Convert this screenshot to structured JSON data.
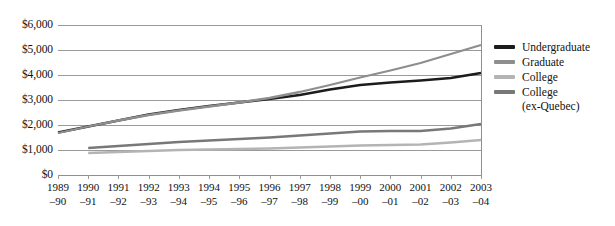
{
  "chart_data": {
    "type": "line",
    "title": "",
    "subtitle": "",
    "xlabel": "",
    "ylabel": "",
    "ylim": [
      0,
      6000
    ],
    "ytick_values": [
      0,
      1000,
      2000,
      3000,
      4000,
      5000,
      6000
    ],
    "ytick_labels": [
      "$0",
      "$1,000",
      "$2,000",
      "$3,000",
      "$4,000",
      "$5,000",
      "$6,000"
    ],
    "grid": true,
    "grid_axis": "y",
    "legend_position": "right",
    "categories": [
      "1989–90",
      "1990–91",
      "1991–92",
      "1992–93",
      "1993–94",
      "1994–95",
      "1995–96",
      "1996–97",
      "1997–98",
      "1998–99",
      "1999–00",
      "2000–01",
      "2001–02",
      "2002–03",
      "2003–04"
    ],
    "xtick_labels": [
      {
        "line1": "1989",
        "line2": "–90"
      },
      {
        "line1": "1990",
        "line2": "–91"
      },
      {
        "line1": "1991",
        "line2": "–92"
      },
      {
        "line1": "1992",
        "line2": "–93"
      },
      {
        "line1": "1993",
        "line2": "–94"
      },
      {
        "line1": "1994",
        "line2": "–95"
      },
      {
        "line1": "1995",
        "line2": "–96"
      },
      {
        "line1": "1996",
        "line2": "–97"
      },
      {
        "line1": "1997",
        "line2": "–98"
      },
      {
        "line1": "1998",
        "line2": "–99"
      },
      {
        "line1": "1999",
        "line2": "–00"
      },
      {
        "line1": "2000",
        "line2": "–01"
      },
      {
        "line1": "2001",
        "line2": "–02"
      },
      {
        "line1": "2002",
        "line2": "–03"
      },
      {
        "line1": "2003",
        "line2": "–04"
      }
    ],
    "series": [
      {
        "name": "Undergraduate",
        "color": "#1c1c1c",
        "values": [
          1700,
          1940,
          2180,
          2420,
          2600,
          2760,
          2900,
          3040,
          3200,
          3420,
          3600,
          3700,
          3780,
          3880,
          4080
        ]
      },
      {
        "name": "Graduate",
        "color": "#8e8e8e",
        "values": [
          1680,
          1940,
          2180,
          2400,
          2580,
          2740,
          2900,
          3080,
          3320,
          3600,
          3900,
          4180,
          4480,
          4840,
          5200
        ]
      },
      {
        "name": "College",
        "color": "#b4b4b4",
        "values": [
          null,
          880,
          920,
          960,
          1000,
          1020,
          1040,
          1060,
          1100,
          1140,
          1180,
          1200,
          1220,
          1300,
          1400
        ]
      },
      {
        "name": "College (ex-Quebec)",
        "color": "#787878",
        "values": [
          null,
          1080,
          1160,
          1240,
          1320,
          1380,
          1440,
          1500,
          1580,
          1660,
          1740,
          1760,
          1760,
          1860,
          2040
        ]
      }
    ]
  },
  "legend": {
    "entries": [
      {
        "label": "Undergraduate",
        "sub": "",
        "color": "#1c1c1c"
      },
      {
        "label": "Graduate",
        "sub": "",
        "color": "#8e8e8e"
      },
      {
        "label": "College",
        "sub": "",
        "color": "#b4b4b4"
      },
      {
        "label": "College",
        "sub": "(ex-Quebec)",
        "color": "#787878"
      }
    ]
  },
  "colors": {
    "gridline": "#9a9a9a",
    "axis": "#8f8f8f",
    "text": "#111111",
    "background": "#ffffff"
  }
}
